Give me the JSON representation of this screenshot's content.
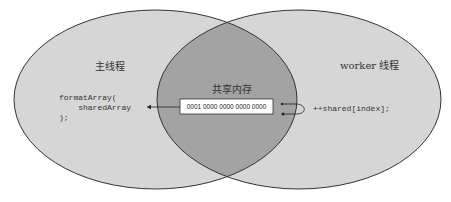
{
  "diagram": {
    "type": "venn",
    "left_circle": {
      "label": "主线程",
      "code_lines": [
        "formatArray(",
        "    sharedArray",
        ");"
      ],
      "fill": "#d6d6d6"
    },
    "right_circle": {
      "label": "worker 线程",
      "code_lines": [
        "++shared[index];"
      ],
      "fill": "#d6d6d6"
    },
    "intersection": {
      "label": "共享内存",
      "memory_value": "0001 0000 0000 0000 0000",
      "fill": "#a3a3a3"
    },
    "colors": {
      "stroke": "#333333",
      "box_fill": "#ffffff"
    }
  }
}
